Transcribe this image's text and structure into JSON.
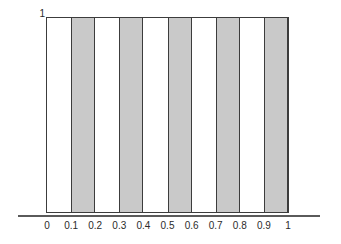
{
  "chart_data": {
    "type": "bar",
    "title": "",
    "subtitle": "",
    "xlabel": "",
    "ylabel": "",
    "grid": false,
    "legend": null,
    "xlim": [
      0,
      1
    ],
    "ylim": [
      0,
      1
    ],
    "x_tick_labels": [
      "0",
      "0.1",
      "0.2",
      "0.3",
      "0.4",
      "0.5",
      "0.6",
      "0.7",
      "0.8",
      "0.9",
      "1"
    ],
    "x_tick_values": [
      0,
      0.1,
      0.2,
      0.3,
      0.4,
      0.5,
      0.6,
      0.7,
      0.8,
      0.9,
      1
    ],
    "y_tick_labels": [
      "1"
    ],
    "y_tick_values": [
      1
    ],
    "bar_edges": [
      0,
      0.1,
      0.2,
      0.3,
      0.4,
      0.5,
      0.6,
      0.7,
      0.8,
      0.9,
      1
    ],
    "categories": [
      "0-0.1",
      "0.1-0.2",
      "0.2-0.3",
      "0.3-0.4",
      "0.4-0.5",
      "0.5-0.6",
      "0.6-0.7",
      "0.7-0.8",
      "0.8-0.9",
      "0.9-1"
    ],
    "values": [
      1,
      1,
      1,
      1,
      1,
      1,
      1,
      1,
      1,
      1
    ],
    "bars": [
      {
        "x0": 0.0,
        "x1": 0.1,
        "height": 1,
        "filled": false
      },
      {
        "x0": 0.1,
        "x1": 0.2,
        "height": 1,
        "filled": true
      },
      {
        "x0": 0.2,
        "x1": 0.3,
        "height": 1,
        "filled": false
      },
      {
        "x0": 0.3,
        "x1": 0.4,
        "height": 1,
        "filled": true
      },
      {
        "x0": 0.4,
        "x1": 0.5,
        "height": 1,
        "filled": false
      },
      {
        "x0": 0.5,
        "x1": 0.6,
        "height": 1,
        "filled": true
      },
      {
        "x0": 0.6,
        "x1": 0.7,
        "height": 1,
        "filled": false
      },
      {
        "x0": 0.7,
        "x1": 0.8,
        "height": 1,
        "filled": true
      },
      {
        "x0": 0.8,
        "x1": 0.9,
        "height": 1,
        "filled": false
      },
      {
        "x0": 0.9,
        "x1": 1.0,
        "height": 1,
        "filled": true
      }
    ],
    "colors": {
      "fill": "#c9c9c9",
      "edge": "#3c3c3c",
      "axis": "#5a5a5a",
      "text": "#2b2b2b",
      "background": "#ffffff"
    }
  }
}
